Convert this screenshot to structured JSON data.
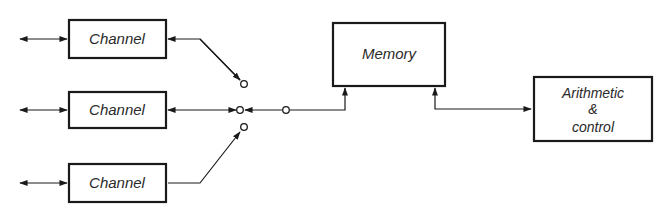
{
  "diagram": {
    "type": "block-diagram",
    "nodes": [
      {
        "id": "channel-1",
        "label": "Channel"
      },
      {
        "id": "channel-2",
        "label": "Channel"
      },
      {
        "id": "channel-3",
        "label": "Channel"
      },
      {
        "id": "memory",
        "label": "Memory"
      },
      {
        "id": "arithmetic-control",
        "label_lines": [
          "Arithmetic",
          "&",
          "control"
        ]
      }
    ],
    "switch": {
      "contacts": 3,
      "selected": "channel-2"
    },
    "edges": [
      {
        "from": "external-1",
        "to": "channel-1",
        "bidirectional": true
      },
      {
        "from": "external-2",
        "to": "channel-2",
        "bidirectional": true
      },
      {
        "from": "external-3",
        "to": "channel-3",
        "bidirectional": true
      },
      {
        "from": "switch",
        "to": "channel-1"
      },
      {
        "from": "switch",
        "to": "channel-2"
      },
      {
        "from": "switch",
        "to": "channel-3"
      },
      {
        "from": "switch",
        "to": "memory"
      },
      {
        "from": "memory",
        "to": "arithmetic-control",
        "bidirectional": true
      }
    ]
  }
}
